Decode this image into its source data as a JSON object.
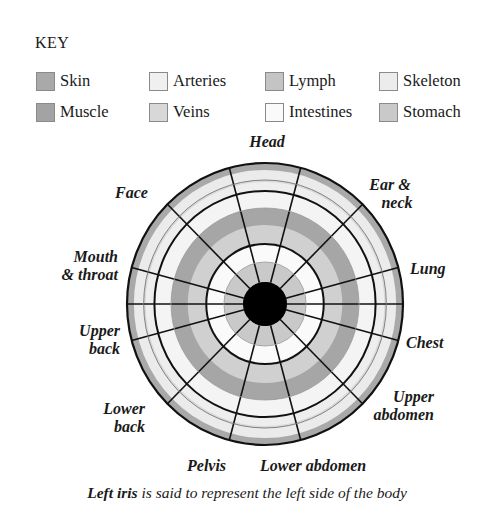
{
  "key": {
    "title": "KEY",
    "items": [
      {
        "label": "Skin",
        "color": "#a9a9a9",
        "x": 36,
        "y": 70
      },
      {
        "label": "Muscle",
        "color": "#a3a3a3",
        "x": 36,
        "y": 101
      },
      {
        "label": "Arteries",
        "color": "#f0f0f0",
        "x": 149,
        "y": 70
      },
      {
        "label": "Veins",
        "color": "#d8d8d8",
        "x": 149,
        "y": 101
      },
      {
        "label": "Lymph",
        "color": "#c4c4c4",
        "x": 265,
        "y": 70
      },
      {
        "label": "Intestines",
        "color": "#fafafa",
        "x": 265,
        "y": 101
      },
      {
        "label": "Skeleton",
        "color": "#ececec",
        "x": 379,
        "y": 70
      },
      {
        "label": "Stomach",
        "color": "#c9c9c9",
        "x": 379,
        "y": 101
      }
    ]
  },
  "diagram": {
    "center": {
      "x": 265,
      "y": 304
    },
    "rings": [
      {
        "name": "skin",
        "r": 141,
        "fill": "#a9a9a9"
      },
      {
        "name": "skeleton",
        "r": 134,
        "fill": "#ebebeb"
      },
      {
        "name": "veins",
        "r": 124,
        "fill": "#d9d9d9"
      },
      {
        "name": "arteries",
        "r": 122,
        "fill": "#eeeeee"
      },
      {
        "name": "boundary-outer",
        "r": 113,
        "fill": "#f4f4f4"
      },
      {
        "name": "muscle",
        "r": 96,
        "fill": "#a6a6a6"
      },
      {
        "name": "lymph",
        "r": 79,
        "fill": "#d0d0d0"
      },
      {
        "name": "boundary-inner",
        "r": 60,
        "fill": "#fafafa"
      },
      {
        "name": "stomach",
        "r": 42,
        "fill": "#c9c9c9"
      },
      {
        "name": "pupil",
        "r": 22,
        "fill": "#000000"
      }
    ],
    "sectors": [
      {
        "label": "Head",
        "angle": 0
      },
      {
        "label": "Ear & neck",
        "angle": 30
      },
      {
        "label": "Lung",
        "angle": 60
      },
      {
        "label": "Chest",
        "angle": 90
      },
      {
        "label": "Upper abdomen",
        "angle": 120
      },
      {
        "label": "Lower abdomen",
        "angle": 165
      },
      {
        "label": "Pelvis",
        "angle": 195
      },
      {
        "label": "Lower back",
        "angle": 225
      },
      {
        "label": "Upper back",
        "angle": 255
      },
      {
        "label": "Mouth & throat",
        "angle": 285
      },
      {
        "label": "Face",
        "angle": 315
      }
    ]
  },
  "labels": {
    "head": "Head",
    "ear_neck_1": "Ear &",
    "ear_neck_2": "neck",
    "lung": "Lung",
    "chest": "Chest",
    "upper_abdomen_1": "Upper",
    "upper_abdomen_2": "abdomen",
    "lower_abdomen": "Lower abdomen",
    "pelvis": "Pelvis",
    "lower_back_1": "Lower",
    "lower_back_2": "back",
    "upper_back_1": "Upper",
    "upper_back_2": "back",
    "mouth_throat_1": "Mouth",
    "mouth_throat_2": "& throat",
    "face": "Face"
  },
  "caption": {
    "bold": "Left iris",
    "rest": " is said to represent the left side of the body"
  }
}
